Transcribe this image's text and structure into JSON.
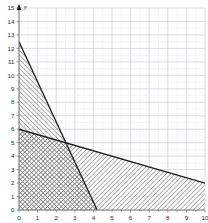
{
  "chart_data": {
    "type": "line",
    "title": "",
    "subtitle": "",
    "xlabel": "x",
    "ylabel": "y",
    "xlim": [
      0,
      10
    ],
    "ylim": [
      0,
      15
    ],
    "grid": true,
    "grid_major_step_x": 1,
    "grid_major_step_y": 1,
    "grid_minor_step_x": 0.5,
    "grid_minor_step_y": 0.5,
    "legend": "none",
    "x_ticks": [
      "0",
      "1",
      "2",
      "3",
      "4",
      "5",
      "6",
      "7",
      "8",
      "9",
      "10"
    ],
    "y_ticks": [
      "0",
      "1",
      "2",
      "3",
      "4",
      "5",
      "6",
      "7",
      "8",
      "9",
      "10",
      "11",
      "12",
      "13",
      "14",
      "15"
    ],
    "series": [
      {
        "name": "steep-constraint-line",
        "x": [
          0,
          4.2
        ],
        "y": [
          12.5,
          0
        ],
        "y_intercept": 12.5,
        "x_intercept": 4.2,
        "slope": -2.98,
        "color": "#1a1a1a"
      },
      {
        "name": "shallow-constraint-line",
        "x": [
          0,
          10
        ],
        "y": [
          6,
          2
        ],
        "y_intercept": 6,
        "x_intercept": 15,
        "slope": -0.4,
        "color": "#1a1a1a"
      }
    ],
    "annotations": [
      {
        "name": "intersection-point",
        "x": 2.5,
        "y": 5,
        "label": ""
      }
    ],
    "shaded_regions": [
      {
        "name": "region-under-steep-line",
        "pattern": "diagonal-hatch",
        "color": "#8c8c8c",
        "description": "Area bounded by the steep line, the y-axis and the x-axis"
      },
      {
        "name": "region-under-shallow-line",
        "pattern": "diagonal-hatch",
        "color": "#9a9a9a",
        "description": "Area bounded by the shallow line, the y-axis and the x-axis"
      },
      {
        "name": "region-overlap",
        "pattern": "cross-hatch",
        "color": "#6b6b6b",
        "description": "Overlap of both shaded half-planes, darkest fill"
      }
    ],
    "colors": {
      "grid_major": "#c9cfd6",
      "grid_minor": "#e6eaee",
      "axis": "#6e6e6e",
      "line": "#1a1a1a",
      "background": "#ffffff"
    }
  },
  "axes": {
    "x_axis_name": "x",
    "y_axis_name": "y"
  }
}
